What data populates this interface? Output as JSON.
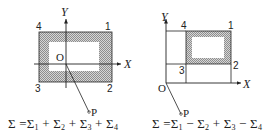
{
  "figures": [
    {
      "id": "left",
      "axis_x_label": "X",
      "axis_y_label": "Y",
      "origin_label": "O",
      "point_label": "P",
      "corner_labels": [
        "1",
        "2",
        "3",
        "4"
      ],
      "formula": {
        "lhs": "Σ",
        "eq": "=",
        "terms": [
          {
            "sign": "",
            "sym": "Σ",
            "sub": "1"
          },
          {
            "sign": "+",
            "sym": "Σ",
            "sub": "2"
          },
          {
            "sign": "+",
            "sym": "Σ",
            "sub": "3"
          },
          {
            "sign": "+",
            "sym": "Σ",
            "sub": "4"
          }
        ]
      }
    },
    {
      "id": "right",
      "axis_x_label": "X",
      "axis_y_label": "Y",
      "origin_label": "O",
      "point_label": "P",
      "corner_labels": [
        "1",
        "2",
        "3",
        "4"
      ],
      "formula": {
        "lhs": "Σ",
        "eq": "=",
        "terms": [
          {
            "sign": "",
            "sym": "Σ",
            "sub": "1"
          },
          {
            "sign": "−",
            "sym": "Σ",
            "sub": "2"
          },
          {
            "sign": "+",
            "sym": "Σ",
            "sub": "3"
          },
          {
            "sign": "−",
            "sym": "Σ",
            "sub": "4"
          }
        ]
      }
    }
  ],
  "colors": {
    "line": "#222222",
    "hatch": "#9a9a9a",
    "hatch_bg": "#d4d4d4"
  }
}
